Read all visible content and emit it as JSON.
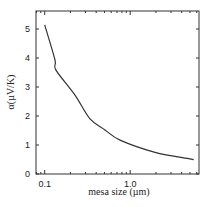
{
  "chart_data": {
    "type": "line",
    "title": "",
    "xlabel": "mesa size (µm)",
    "ylabel": "α(µV/K)",
    "xscale": "log",
    "xlim": [
      0.085,
      6.4
    ],
    "ylim": [
      0,
      5.6
    ],
    "grid": false,
    "legend": null,
    "x_ticks": [
      0.1,
      1.0
    ],
    "x_tick_labels": [
      "0.1",
      "1.0"
    ],
    "y_ticks": [
      0,
      1,
      2,
      3,
      4,
      5
    ],
    "y_tick_labels": [
      "0",
      "1",
      "2",
      "3",
      "4",
      "5"
    ],
    "series": [
      {
        "name": "alpha",
        "color": "#333333",
        "x": [
          0.1,
          0.132,
          0.135,
          0.226,
          0.339,
          0.507,
          0.76,
          1.95,
          5.0,
          5.3
        ],
        "y": [
          5.14,
          3.93,
          3.59,
          2.72,
          1.9,
          1.52,
          1.17,
          0.75,
          0.52,
          0.5
        ]
      }
    ]
  }
}
